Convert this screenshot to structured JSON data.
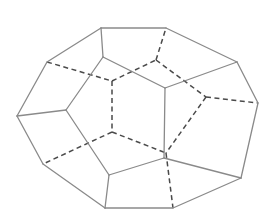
{
  "diagram": {
    "title": "",
    "type": "polyhedron-wireframe",
    "colors": {
      "background": "#ffffff",
      "solid_edge": "#8a8a8a",
      "hidden_edge": "#4a4a4a"
    },
    "vertices": {
      "A": [
        101,
        28
      ],
      "B": [
        166,
        28
      ],
      "C": [
        237,
        62
      ],
      "D": [
        258,
        103
      ],
      "E": [
        241,
        178
      ],
      "F": [
        173,
        208
      ],
      "G": [
        105,
        208
      ],
      "H": [
        43,
        164
      ],
      "I": [
        17,
        116
      ],
      "J": [
        47,
        62
      ],
      "K": [
        103,
        57
      ],
      "L": [
        165,
        88
      ],
      "M": [
        66,
        110
      ],
      "N": [
        109,
        175
      ],
      "O": [
        164,
        158
      ],
      "P": [
        112,
        81
      ],
      "R": [
        156,
        60
      ],
      "S": [
        206,
        97
      ],
      "T": [
        112,
        132
      ],
      "U": [
        166,
        153
      ]
    },
    "visible_edges": [
      [
        "A",
        "B"
      ],
      [
        "B",
        "C"
      ],
      [
        "C",
        "D"
      ],
      [
        "D",
        "E"
      ],
      [
        "E",
        "F"
      ],
      [
        "F",
        "G"
      ],
      [
        "G",
        "H"
      ],
      [
        "H",
        "I"
      ],
      [
        "I",
        "J"
      ],
      [
        "J",
        "A"
      ],
      [
        "A",
        "K"
      ],
      [
        "K",
        "L"
      ],
      [
        "L",
        "C"
      ],
      [
        "K",
        "M"
      ],
      [
        "I",
        "M"
      ],
      [
        "M",
        "N"
      ],
      [
        "N",
        "G"
      ],
      [
        "N",
        "O"
      ],
      [
        "O",
        "L"
      ],
      [
        "O",
        "E"
      ]
    ],
    "hidden_edges": [
      [
        "J",
        "P"
      ],
      [
        "P",
        "R"
      ],
      [
        "R",
        "B"
      ],
      [
        "R",
        "S"
      ],
      [
        "S",
        "D"
      ],
      [
        "S",
        "U"
      ],
      [
        "P",
        "T"
      ],
      [
        "T",
        "H"
      ],
      [
        "T",
        "U"
      ],
      [
        "U",
        "F"
      ]
    ]
  }
}
